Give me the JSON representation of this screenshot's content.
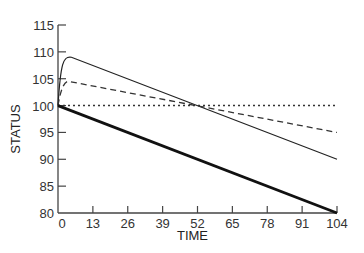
{
  "chart_data": {
    "type": "line",
    "title": "",
    "xlabel": "TIME",
    "ylabel": "STATUS",
    "xlim": [
      0,
      104
    ],
    "ylim": [
      80,
      115
    ],
    "xticks": [
      0,
      13,
      26,
      39,
      52,
      65,
      78,
      91,
      104
    ],
    "yticks": [
      80,
      85,
      90,
      95,
      100,
      105,
      110,
      115
    ],
    "grid": false,
    "legend": null,
    "series": [
      {
        "name": "thin-solid",
        "style": "solid-thin",
        "x": [
          0,
          1,
          2,
          3,
          5,
          8,
          104
        ],
        "y": [
          100,
          105,
          107.5,
          108.5,
          109,
          108.8,
          90
        ]
      },
      {
        "name": "dashed",
        "style": "dashed",
        "x": [
          0,
          2,
          4,
          104
        ],
        "y": [
          100,
          104,
          104.5,
          95
        ]
      },
      {
        "name": "dotted",
        "style": "dotted",
        "x": [
          0,
          104
        ],
        "y": [
          100,
          100
        ]
      },
      {
        "name": "thick-solid",
        "style": "solid-thick",
        "x": [
          0,
          104
        ],
        "y": [
          100,
          80
        ]
      }
    ]
  }
}
